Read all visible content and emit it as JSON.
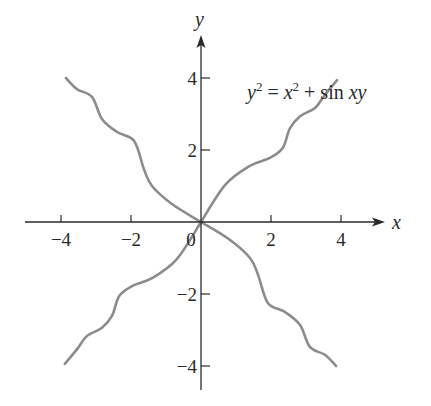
{
  "chart_data": {
    "type": "line",
    "title": "",
    "annotation": "y^2 = x^2 + sin xy",
    "annotation_parts": {
      "lhs_var": "y",
      "lhs_exp": "2",
      "eq": "=",
      "rhs_var": "x",
      "rhs_exp": "2",
      "plus": "+",
      "func": "sin",
      "arg": "xy"
    },
    "xlabel": "x",
    "ylabel": "y",
    "xlim": [
      -5.2,
      5.3
    ],
    "ylim": [
      -5,
      5.2
    ],
    "grid": false,
    "legend": null,
    "x_ticks": [
      -4,
      -2,
      0,
      2,
      4
    ],
    "x_tick_labels": [
      "−4",
      "−2",
      "0",
      "2",
      "4"
    ],
    "y_ticks": [
      -4,
      -2,
      2,
      4
    ],
    "y_tick_labels": [
      "−4",
      "−2",
      "2",
      "4"
    ],
    "curve_color": "#8c8c8c",
    "axis_color": "#2a2a2a",
    "series": [
      {
        "name": "upper-right branch",
        "x": [
          0,
          0.69,
          1.4,
          1.97,
          2.34,
          2.54,
          2.83,
          3.26,
          3.54,
          3.89
        ],
        "y": [
          0,
          1.03,
          1.56,
          1.78,
          2.06,
          2.6,
          2.94,
          3.17,
          3.53,
          3.94
        ]
      },
      {
        "name": "lower-right branch",
        "x": [
          0,
          0.83,
          1.4,
          1.63,
          1.91,
          2.4,
          2.83,
          3.11,
          3.54,
          3.86
        ],
        "y": [
          0,
          -0.5,
          -1.0,
          -1.47,
          -2.25,
          -2.5,
          -2.86,
          -3.47,
          -3.69,
          -4.0
        ]
      },
      {
        "name": "lower-left branch",
        "x": [
          0,
          -0.69,
          -1.4,
          -1.97,
          -2.34,
          -2.54,
          -2.83,
          -3.26,
          -3.54,
          -3.89
        ],
        "y": [
          0,
          -1.03,
          -1.56,
          -1.78,
          -2.06,
          -2.6,
          -2.94,
          -3.17,
          -3.53,
          -3.94
        ]
      },
      {
        "name": "upper-left branch",
        "x": [
          0,
          -0.83,
          -1.4,
          -1.63,
          -1.91,
          -2.4,
          -2.83,
          -3.11,
          -3.54,
          -3.86
        ],
        "y": [
          0,
          0.5,
          1.0,
          1.47,
          2.25,
          2.5,
          2.86,
          3.47,
          3.69,
          4.0
        ]
      }
    ]
  }
}
